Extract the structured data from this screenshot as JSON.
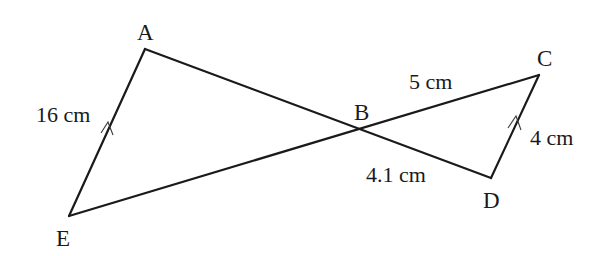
{
  "figure": {
    "width": 616,
    "height": 256,
    "stroke_color": "#1a1a1a",
    "background": "#ffffff"
  },
  "vertices": {
    "A": {
      "label": "A",
      "x": 145,
      "y": 49
    },
    "B": {
      "label": "B",
      "x": 358,
      "y": 128
    },
    "C": {
      "label": "C",
      "x": 539,
      "y": 75
    },
    "D": {
      "label": "D",
      "x": 491,
      "y": 178
    },
    "E": {
      "label": "E",
      "x": 69,
      "y": 216
    }
  },
  "segments": [
    {
      "id": "AE",
      "from": "A",
      "to": "E",
      "length_label": "16 cm",
      "parallel_mark": true
    },
    {
      "id": "AD",
      "from": "A",
      "to": "D",
      "passes_through": "B"
    },
    {
      "id": "EC",
      "from": "E",
      "to": "C",
      "passes_through": "B"
    },
    {
      "id": "CD",
      "from": "C",
      "to": "D",
      "length_label": "4 cm",
      "parallel_mark": true
    },
    {
      "id": "BC",
      "from": "B",
      "to": "C",
      "length_label": "5 cm"
    },
    {
      "id": "BD",
      "from": "B",
      "to": "D",
      "length_label": "4.1 cm"
    }
  ],
  "labels": {
    "A": "A",
    "B": "B",
    "C": "C",
    "D": "D",
    "E": "E",
    "AE_length": "16 cm",
    "BC_length": "5 cm",
    "BD_length": "4.1 cm",
    "CD_length": "4 cm"
  },
  "annotations": {
    "parallel_note": "AE ∥ DC (arrow marks on both segments)"
  }
}
